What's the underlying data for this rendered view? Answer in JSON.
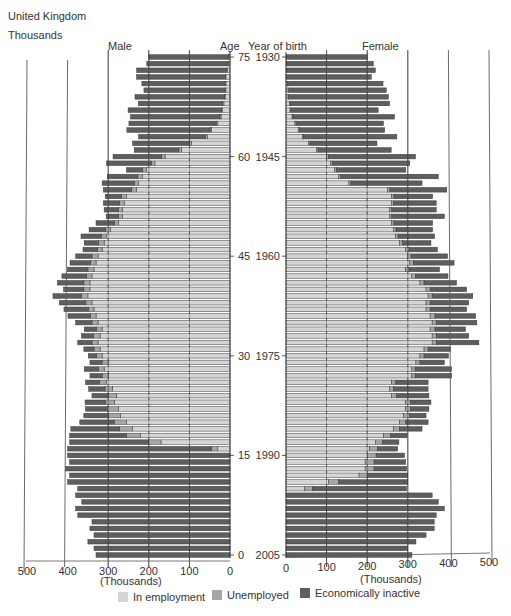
{
  "header": {
    "region": "United Kingdom",
    "units": "Thousands"
  },
  "labels": {
    "male": "Male",
    "female": "Female",
    "age": "Age",
    "year_of_birth": "Year of birth",
    "x_unit_left": "(Thousands)",
    "x_unit_right": "(Thousands)"
  },
  "colors": {
    "employment": "#d4d4d4",
    "unemployed": "#a6a6a6",
    "inactive": "#5e5e5e",
    "bar_outline": "#3a3a3a",
    "grid": "#444444"
  },
  "legend": [
    {
      "key": "employment",
      "label": "In employment"
    },
    {
      "key": "unemployed",
      "label": "Unemployed"
    },
    {
      "key": "inactive",
      "label": "Economically inactive"
    }
  ],
  "chart_data": {
    "type": "bar",
    "subtype": "population pyramid (stacked horizontal bars)",
    "title": "United Kingdom",
    "units": "Thousands",
    "xlabel": "(Thousands)",
    "ylabel_left": "Age",
    "ylabel_right": "Year of birth",
    "xlim": [
      0,
      500
    ],
    "x_ticks": [
      0,
      100,
      200,
      300,
      400,
      500
    ],
    "age_ticks": [
      75,
      60,
      45,
      30,
      15,
      0
    ],
    "year_ticks": [
      1930,
      1945,
      1960,
      1975,
      1990,
      2005
    ],
    "grid": true,
    "legend_position": "bottom",
    "ages": [
      75,
      74,
      73,
      72,
      71,
      70,
      69,
      68,
      67,
      66,
      65,
      64,
      63,
      62,
      61,
      60,
      59,
      58,
      57,
      56,
      55,
      54,
      53,
      52,
      51,
      50,
      49,
      48,
      47,
      46,
      45,
      44,
      43,
      42,
      41,
      40,
      39,
      38,
      37,
      36,
      35,
      34,
      33,
      32,
      31,
      30,
      29,
      28,
      27,
      26,
      25,
      24,
      23,
      22,
      21,
      20,
      19,
      18,
      17,
      16,
      15,
      14,
      13,
      12,
      11,
      10,
      9,
      8,
      7,
      6,
      5,
      4,
      3,
      2,
      1,
      0
    ],
    "male": {
      "in_employment": [
        3,
        4,
        7,
        10,
        10,
        10,
        12,
        15,
        18,
        22,
        30,
        45,
        55,
        95,
        120,
        160,
        185,
        205,
        215,
        225,
        230,
        255,
        260,
        265,
        265,
        275,
        295,
        305,
        310,
        315,
        325,
        330,
        335,
        340,
        345,
        345,
        350,
        340,
        335,
        330,
        325,
        315,
        320,
        325,
        320,
        315,
        300,
        310,
        300,
        305,
        290,
        280,
        285,
        275,
        270,
        255,
        240,
        220,
        170,
        30,
        0,
        0,
        0,
        0,
        0,
        0,
        0,
        0,
        0,
        0,
        0,
        0,
        0,
        0,
        0,
        0
      ],
      "unemployed": [
        1,
        1,
        1,
        1,
        2,
        2,
        2,
        3,
        3,
        3,
        4,
        4,
        5,
        5,
        6,
        8,
        9,
        10,
        12,
        10,
        12,
        12,
        12,
        10,
        10,
        10,
        12,
        12,
        14,
        12,
        15,
        14,
        15,
        14,
        15,
        15,
        16,
        15,
        14,
        14,
        15,
        14,
        16,
        15,
        15,
        14,
        15,
        14,
        15,
        16,
        18,
        20,
        22,
        26,
        30,
        30,
        32,
        35,
        30,
        15,
        0,
        0,
        0,
        0,
        0,
        0,
        0,
        0,
        0,
        0,
        0,
        0,
        0,
        0,
        0,
        0
      ],
      "inactive": [
        196,
        200,
        222,
        219,
        205,
        200,
        220,
        208,
        230,
        220,
        215,
        205,
        165,
        140,
        110,
        120,
        110,
        40,
        75,
        80,
        70,
        40,
        40,
        35,
        30,
        45,
        40,
        50,
        35,
        35,
        40,
        50,
        50,
        60,
        65,
        50,
        70,
        65,
        60,
        55,
        40,
        30,
        30,
        35,
        25,
        20,
        30,
        35,
        30,
        35,
        40,
        40,
        50,
        55,
        60,
        85,
        120,
        140,
        195,
        355,
        400,
        395,
        405,
        395,
        400,
        375,
        380,
        365,
        380,
        375,
        340,
        345,
        335,
        350,
        335,
        330
      ]
    },
    "female": {
      "in_employment": [
        0,
        0,
        0,
        0,
        3,
        5,
        5,
        8,
        10,
        15,
        22,
        30,
        40,
        55,
        75,
        100,
        110,
        120,
        130,
        155,
        250,
        260,
        260,
        255,
        255,
        260,
        265,
        270,
        280,
        295,
        300,
        305,
        295,
        310,
        330,
        345,
        350,
        345,
        345,
        355,
        360,
        355,
        360,
        360,
        340,
        330,
        320,
        310,
        310,
        260,
        255,
        260,
        295,
        295,
        290,
        280,
        265,
        240,
        220,
        205,
        200,
        195,
        195,
        180,
        105,
        45,
        0,
        0,
        0,
        0,
        0,
        0,
        0,
        0,
        0,
        0
      ],
      "unemployed": [
        0,
        0,
        0,
        0,
        1,
        2,
        2,
        2,
        2,
        2,
        3,
        3,
        3,
        4,
        4,
        4,
        5,
        5,
        5,
        5,
        6,
        6,
        5,
        5,
        5,
        6,
        6,
        6,
        7,
        8,
        8,
        9,
        8,
        9,
        10,
        10,
        10,
        10,
        10,
        12,
        10,
        12,
        10,
        10,
        10,
        10,
        10,
        8,
        8,
        10,
        10,
        12,
        12,
        12,
        15,
        15,
        15,
        18,
        18,
        20,
        22,
        22,
        22,
        20,
        25,
        20,
        0,
        0,
        0,
        0,
        0,
        0,
        0,
        0,
        0,
        0
      ],
      "inactive": [
        200,
        215,
        220,
        210,
        235,
        240,
        245,
        245,
        215,
        250,
        215,
        210,
        230,
        165,
        180,
        215,
        190,
        170,
        240,
        175,
        140,
        95,
        105,
        110,
        130,
        95,
        90,
        90,
        70,
        70,
        90,
        100,
        75,
        80,
        80,
        90,
        100,
        95,
        90,
        100,
        100,
        75,
        80,
        105,
        55,
        60,
        60,
        90,
        90,
        80,
        85,
        80,
        50,
        45,
        40,
        55,
        55,
        40,
        40,
        50,
        70,
        78,
        80,
        100,
        170,
        232,
        360,
        375,
        390,
        370,
        365,
        365,
        345,
        320,
        300,
        310
      ]
    }
  }
}
